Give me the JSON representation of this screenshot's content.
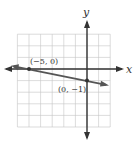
{
  "chart_data": {
    "type": "line",
    "title": "",
    "xlabel": "x",
    "ylabel": "y",
    "xlim": [
      -6,
      2
    ],
    "ylim": [
      -5,
      3
    ],
    "grid": true,
    "grid_step": 1,
    "points": [
      {
        "x": -5,
        "y": 0,
        "label": "(−5, 0)"
      },
      {
        "x": 0,
        "y": -1,
        "label": "(0, −1)"
      }
    ],
    "line": {
      "slope": -0.2,
      "intercept": -1,
      "equation": "y = -x/5 - 1"
    },
    "colors": {
      "line": "#555555",
      "axes": "#333333",
      "grid": "#bbbbbb"
    }
  },
  "labels": {
    "x_axis": "x",
    "y_axis": "y",
    "point_a": "(−5, 0)",
    "point_b": "(0, −1)"
  }
}
